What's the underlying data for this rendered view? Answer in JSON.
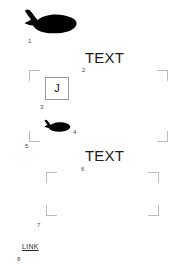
{
  "canvas": {
    "width": 184,
    "height": 280,
    "background": "#ffffff",
    "label_color": "#4a4a4a",
    "bracket_color": "#bdbdbd",
    "text_color": "#1c1c1c",
    "box_border_color": "#9a9a9a",
    "silhouette_color": "#000000"
  },
  "elements": {
    "whale_large": {
      "number": "1",
      "icon": "whale-silhouette-icon"
    },
    "text_top": {
      "number": "2",
      "label": "TEXT"
    },
    "glyph_box": {
      "number": "3",
      "label": "J"
    },
    "whale_small": {
      "number": "4",
      "icon": "whale-silhouette-icon"
    },
    "frame_upper": {
      "number": "5"
    },
    "text_bottom": {
      "number": "6",
      "label": "TEXT"
    },
    "frame_lower": {
      "number": "7"
    },
    "link": {
      "number": "8",
      "label": "LINK"
    }
  }
}
